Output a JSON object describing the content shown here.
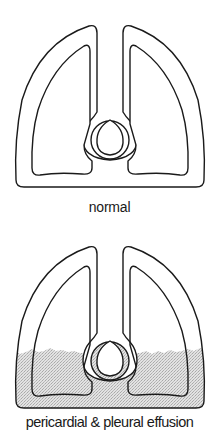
{
  "panels": [
    {
      "id": "normal",
      "caption": "normal",
      "effusion": false
    },
    {
      "id": "effusion",
      "caption": "pericardial & pleural effusion",
      "effusion": true
    }
  ],
  "colors": {
    "stroke": "#1a1a1a",
    "fluid": "#d4d4d4",
    "background": "#ffffff"
  }
}
